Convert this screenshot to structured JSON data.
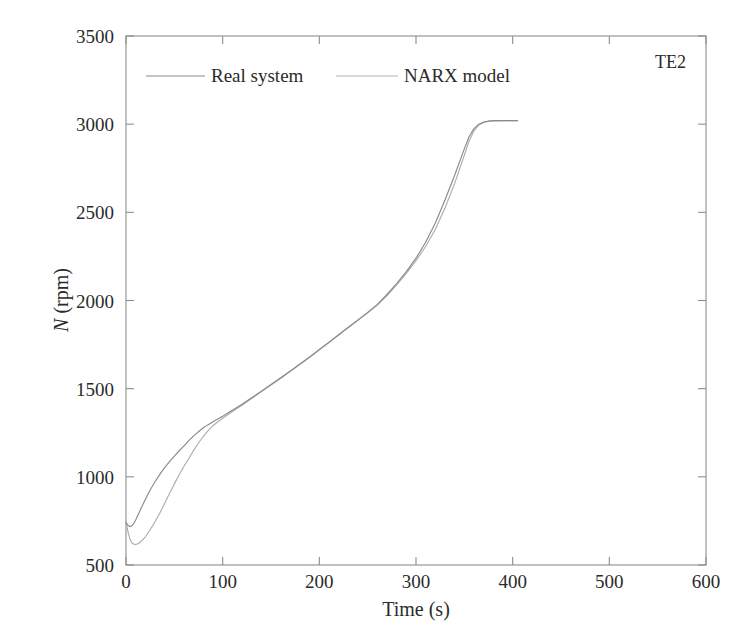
{
  "chart_data": {
    "type": "line",
    "title": "",
    "annotation": "TE2",
    "xlabel": "Time (s)",
    "ylabel": "N (rpm)",
    "ylabel_italic_part": "N",
    "ylabel_rest": " (rpm)",
    "xlim": [
      0,
      600
    ],
    "ylim": [
      500,
      3500
    ],
    "xticks": [
      0,
      100,
      200,
      300,
      400,
      500,
      600
    ],
    "yticks": [
      500,
      1000,
      1500,
      2000,
      2500,
      3000,
      3500
    ],
    "xtick_labels": [
      "0",
      "100",
      "200",
      "300",
      "400",
      "500",
      "600"
    ],
    "ytick_labels": [
      "500",
      "1000",
      "1500",
      "2000",
      "2500",
      "3000",
      "3500"
    ],
    "grid": false,
    "legend_position": "top-center",
    "colors": {
      "real": "#8a8a8a",
      "narx": "#b4b4b4",
      "frame": "#8d8d8d",
      "text": "#2b2b2b"
    },
    "series": [
      {
        "name": "Real system",
        "style": "solid",
        "color": "#8a8a8a",
        "x": [
          0,
          2,
          4,
          6,
          8,
          10,
          13,
          16,
          20,
          25,
          30,
          35,
          40,
          45,
          50,
          55,
          60,
          65,
          70,
          75,
          80,
          85,
          90,
          95,
          100,
          110,
          120,
          130,
          140,
          150,
          160,
          170,
          180,
          190,
          200,
          210,
          220,
          230,
          240,
          250,
          260,
          270,
          280,
          290,
          300,
          310,
          320,
          330,
          340,
          350,
          355,
          360,
          365,
          370,
          375,
          380,
          390,
          400,
          405
        ],
        "y": [
          740,
          725,
          718,
          722,
          735,
          755,
          790,
          826,
          872,
          925,
          972,
          1014,
          1052,
          1086,
          1118,
          1148,
          1176,
          1205,
          1232,
          1256,
          1278,
          1296,
          1312,
          1328,
          1344,
          1378,
          1412,
          1448,
          1486,
          1524,
          1562,
          1600,
          1640,
          1680,
          1722,
          1764,
          1806,
          1848,
          1890,
          1932,
          1978,
          2034,
          2096,
          2164,
          2240,
          2330,
          2440,
          2570,
          2710,
          2860,
          2930,
          2975,
          3000,
          3012,
          3018,
          3020,
          3020,
          3020,
          3020
        ]
      },
      {
        "name": "NARX model",
        "style": "solid",
        "color": "#b4b4b4",
        "x": [
          0,
          2,
          4,
          6,
          8,
          10,
          13,
          16,
          20,
          25,
          30,
          35,
          40,
          45,
          50,
          55,
          60,
          65,
          70,
          75,
          80,
          85,
          90,
          95,
          100,
          110,
          120,
          130,
          140,
          150,
          160,
          170,
          180,
          190,
          200,
          210,
          220,
          230,
          240,
          250,
          260,
          270,
          280,
          290,
          300,
          310,
          320,
          330,
          340,
          350,
          355,
          360,
          365,
          370,
          375,
          380,
          390,
          400,
          405
        ],
        "y": [
          745,
          690,
          648,
          626,
          618,
          616,
          622,
          636,
          660,
          700,
          745,
          795,
          850,
          905,
          960,
          1012,
          1060,
          1104,
          1150,
          1192,
          1230,
          1262,
          1290,
          1312,
          1332,
          1370,
          1406,
          1444,
          1482,
          1520,
          1558,
          1598,
          1638,
          1678,
          1720,
          1762,
          1804,
          1846,
          1888,
          1930,
          1974,
          2028,
          2088,
          2154,
          2226,
          2306,
          2404,
          2524,
          2664,
          2824,
          2906,
          2962,
          2996,
          3010,
          3016,
          3018,
          3020,
          3020,
          3020
        ]
      }
    ]
  },
  "legend": {
    "items": [
      {
        "label": "Real system",
        "style": "solid"
      },
      {
        "label": "NARX model",
        "style": "solid"
      }
    ]
  },
  "annotation": {
    "label": "TE2"
  }
}
